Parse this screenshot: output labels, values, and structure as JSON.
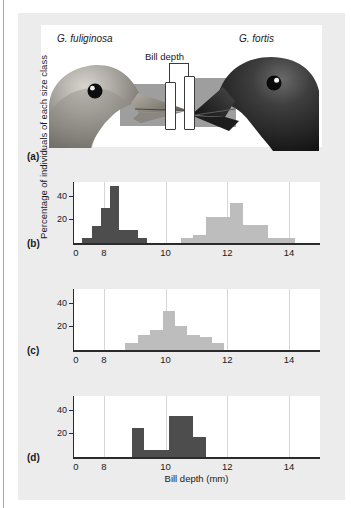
{
  "figure": {
    "panel_a_letter": "(a)",
    "panel_b_letter": "(b)",
    "panel_c_letter": "(c)",
    "panel_d_letter": "(d)"
  },
  "illustration": {
    "left_species": "G. fuliginosa",
    "right_species": "G. fortis",
    "measure_label": "Bill depth",
    "left_bird_icon": "finch-head-light-icon",
    "right_bird_icon": "finch-head-dark-icon",
    "caliper_icon": "caliper-bar-icon"
  },
  "axes": {
    "y_title": "Percentage of individuals of each size class",
    "x_title": "Bill depth (mm)",
    "y_ticks": [
      "20",
      "40"
    ],
    "x_ticks": [
      "0",
      "8",
      "10",
      "12",
      "14"
    ]
  },
  "colors": {
    "dark_bar": "#4d4d4d",
    "light_bar": "#bdbdbd",
    "panel_background": "#ececec",
    "plot_background": "#ffffff",
    "axis": "#2b2b2b",
    "gridline": "#d6d6d6"
  },
  "chart_data": [
    {
      "type": "bar",
      "id": "b",
      "title": "(b) Allopatric populations on separate islands",
      "xlabel": "Bill depth (mm)",
      "ylabel": "Percentage of individuals of each size class",
      "xlim": [
        7.0,
        15.0
      ],
      "ylim": [
        0,
        50
      ],
      "grid": true,
      "x_ticks": [
        0,
        8,
        10,
        12,
        14
      ],
      "y_ticks": [
        20,
        40
      ],
      "series": [
        {
          "name": "G. fuliginosa",
          "color": "#4d4d4d",
          "bin_edges": [
            7.3,
            7.6,
            7.9,
            8.2,
            8.5,
            8.8,
            9.1,
            9.4
          ],
          "values": [
            4,
            14,
            30,
            48,
            11,
            11,
            4
          ]
        },
        {
          "name": "G. fortis",
          "color": "#bdbdbd",
          "bin_edges": [
            10.5,
            10.9,
            11.3,
            11.7,
            12.1,
            12.5,
            12.9,
            13.3,
            14.2
          ],
          "values": [
            4,
            7,
            22,
            22,
            34,
            15,
            15,
            4
          ]
        }
      ]
    },
    {
      "type": "bar",
      "id": "c",
      "title": "(c) G. fortis alone on Los Hermanos",
      "xlabel": "Bill depth (mm)",
      "ylabel": "Percentage of individuals of each size class",
      "xlim": [
        7.0,
        15.0
      ],
      "ylim": [
        0,
        50
      ],
      "grid": true,
      "x_ticks": [
        0,
        8,
        10,
        12,
        14
      ],
      "y_ticks": [
        20,
        40
      ],
      "series": [
        {
          "name": "G. fortis",
          "color": "#bdbdbd",
          "bin_edges": [
            8.7,
            9.1,
            9.5,
            9.9,
            10.3,
            10.7,
            11.1,
            11.5,
            11.9
          ],
          "values": [
            6,
            13,
            17,
            33,
            20,
            13,
            11,
            6
          ]
        }
      ]
    },
    {
      "type": "bar",
      "id": "d",
      "title": "(d) G. fuliginosa alone on Daphne",
      "xlabel": "Bill depth (mm)",
      "ylabel": "Percentage of individuals of each size class",
      "xlim": [
        7.0,
        15.0
      ],
      "ylim": [
        0,
        50
      ],
      "grid": true,
      "x_ticks": [
        0,
        8,
        10,
        12,
        14
      ],
      "y_ticks": [
        20,
        40
      ],
      "series": [
        {
          "name": "G. fuliginosa",
          "color": "#4d4d4d",
          "bin_edges": [
            8.9,
            9.3,
            9.7,
            10.1,
            10.5,
            10.9,
            11.3
          ],
          "values": [
            25,
            6,
            6,
            35,
            35,
            17
          ]
        }
      ]
    }
  ]
}
